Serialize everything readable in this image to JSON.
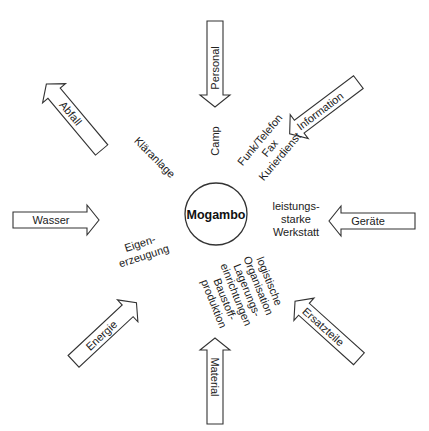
{
  "center": {
    "label": "Mogambo"
  },
  "arrows": {
    "personal": {
      "label": "Personal",
      "direction": "inward"
    },
    "information": {
      "label": "Information",
      "direction": "inward"
    },
    "geraete": {
      "label": "Geräte",
      "direction": "inward"
    },
    "ersatzteile": {
      "label": "Ersatzteile",
      "direction": "outward"
    },
    "material": {
      "label": "Material",
      "direction": "inward"
    },
    "energie": {
      "label": "Energie",
      "direction": "outward"
    },
    "wasser": {
      "label": "Wasser",
      "direction": "inward"
    },
    "abfall": {
      "label": "Abfall",
      "direction": "outward"
    }
  },
  "inner_labels": {
    "camp": "Camp",
    "funk": [
      "Funk/Telefon",
      "Fax",
      "Kurierdienst"
    ],
    "werkstatt": [
      "leistungs-",
      "starke",
      "Werkstatt"
    ],
    "logistik": [
      "logistische",
      "Organisation",
      "Lagerungs-",
      "einrichtungen",
      "Baustoff-",
      "produktion"
    ],
    "eigen": [
      "Eigen-",
      "erzeugung"
    ],
    "klaeranlage": "Kläranlage"
  },
  "colors": {
    "stroke": "#333333",
    "text": "#222222",
    "background": "#ffffff"
  }
}
